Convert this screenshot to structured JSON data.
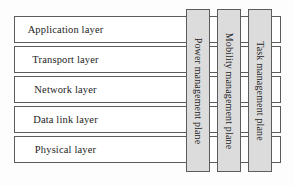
{
  "diagram": {
    "background_color": "#fdfdfd",
    "layer_box_fill": "#ffffff",
    "plane_box_fill": "#dcdcdc",
    "border_color": "#5c5c5c",
    "text_color": "#1d1d1d",
    "layers": [
      {
        "label": "Application layer"
      },
      {
        "label": "Transport layer"
      },
      {
        "label": "Network layer"
      },
      {
        "label": "Data link layer"
      },
      {
        "label": "Physical layer"
      }
    ],
    "planes": [
      {
        "label": "Power management plane"
      },
      {
        "label": "Mobility management plane"
      },
      {
        "label": "Task management plane"
      }
    ]
  }
}
